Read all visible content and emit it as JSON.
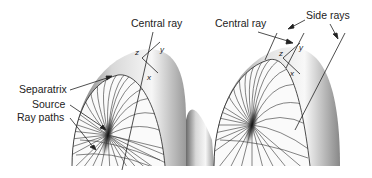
{
  "figure": {
    "panels": [
      {
        "id": "left",
        "labels": {
          "central_ray": "Central ray",
          "separatrix": "Separatrix",
          "source": "Source",
          "ray_paths": "Ray paths"
        },
        "axes": {
          "z": "z",
          "y": "y",
          "x": "x"
        }
      },
      {
        "id": "right",
        "labels": {
          "central_ray": "Central ray",
          "side_rays": "Side rays"
        },
        "axes": {
          "z": "z",
          "y": "y",
          "x": "x"
        }
      }
    ],
    "colors": {
      "background": "#ffffff",
      "line": "#222222",
      "surface_light": "#f2f2f2",
      "surface_dark": "#5a5a5a"
    }
  }
}
